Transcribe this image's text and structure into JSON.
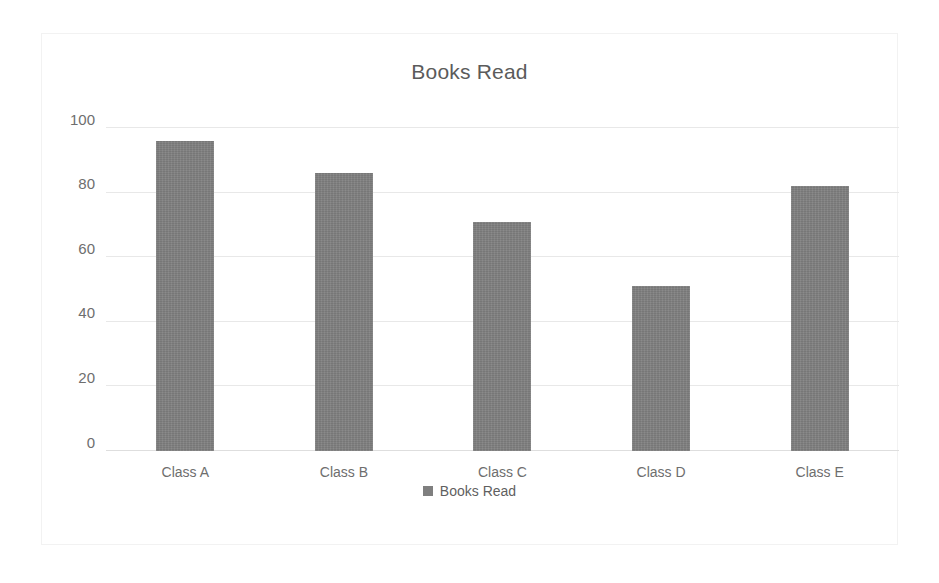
{
  "chart_data": {
    "type": "bar",
    "title": "Books Read",
    "categories": [
      "Class A",
      "Class B",
      "Class C",
      "Class D",
      "Class E"
    ],
    "values": [
      96,
      86,
      71,
      51,
      82
    ],
    "series": [
      {
        "name": "Books Read",
        "values": [
          96,
          86,
          71,
          51,
          82
        ]
      }
    ],
    "xlabel": "",
    "ylabel": "",
    "ylim": [
      0,
      100
    ],
    "yticks": [
      0,
      20,
      40,
      60,
      80,
      100
    ],
    "ytick_labels": [
      "0",
      "20",
      "40",
      "60",
      "80",
      "100"
    ],
    "grid": true,
    "legend": {
      "position": "bottom",
      "entries": [
        {
          "label": "Books Read",
          "color": "#7f7f7f",
          "marker": "square-marker"
        }
      ]
    },
    "colors": {
      "bar": "#7f7f7f",
      "gridline": "#e8e8e8",
      "axis_text": "#6e6e6e",
      "title_text": "#5b5b5b",
      "background": "#ffffff",
      "frame_border": "#f2f2f2"
    }
  }
}
